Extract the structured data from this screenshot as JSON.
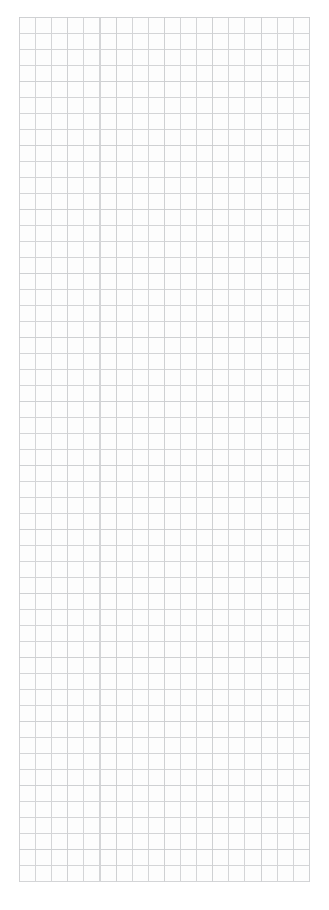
{
  "page": {
    "width_px": 329,
    "height_px": 910,
    "background_color": "#ffffff",
    "content": "blank graph paper, no text or controls visible"
  },
  "grid": {
    "columns": 18,
    "rows": 54,
    "cell_width_px": 16.1,
    "cell_height_px": 16,
    "offset_left_px": 19,
    "offset_top_px": 17,
    "grid_width_px": 291,
    "grid_height_px": 865,
    "line_color": "#d4d5d7",
    "paper_color": "#fdfdfd",
    "margin_right_px": 19,
    "margin_bottom_px": 28
  }
}
